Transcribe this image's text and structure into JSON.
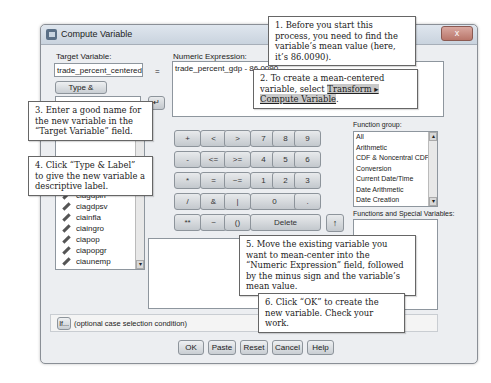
{
  "window": {
    "title": "Compute Variable",
    "close_label": "x"
  },
  "target": {
    "label": "Target Variable:",
    "value": "trade_percent_centered",
    "equals": "=",
    "type_label_button": "Type & Label..."
  },
  "expression": {
    "label": "Numeric Expression:",
    "value": "trade_percent_gdp - 86.0090"
  },
  "variables": {
    "items": [
      {
        "name": "business_starts",
        "type": "scale"
      },
      {
        "name": "ciagdpag",
        "type": "scale"
      },
      {
        "name": "ciagdpin",
        "type": "scale"
      },
      {
        "name": "ciagdpsv",
        "type": "scale"
      },
      {
        "name": "ciainfla",
        "type": "scale"
      },
      {
        "name": "ciaingro",
        "type": "scale"
      },
      {
        "name": "ciapop",
        "type": "scale"
      },
      {
        "name": "ciapopgr",
        "type": "scale"
      },
      {
        "name": "ciaunemp",
        "type": "scale"
      },
      {
        "name": "civil_war",
        "type": "nominal"
      },
      {
        "name": "colony",
        "type": "nominal"
      }
    ]
  },
  "keypad": {
    "keys": [
      "+",
      "<",
      ">",
      "7",
      "8",
      "9",
      "-",
      "<=",
      ">=",
      "4",
      "5",
      "6",
      "*",
      "=",
      "~=",
      "1",
      "2",
      "3",
      "/",
      "&",
      "|",
      "0",
      ".",
      "**",
      "~",
      "()",
      "Delete"
    ],
    "move_arrow": "↑"
  },
  "function_group": {
    "label": "Function group:",
    "items": [
      "All",
      "Arithmetic",
      "CDF & Noncentral CDF",
      "Conversion",
      "Current Date/Time",
      "Date Arithmetic",
      "Date Creation"
    ]
  },
  "functions_special": {
    "label": "Functions and Special Variables:"
  },
  "if_row": {
    "button": "If...",
    "text": "(optional case selection condition)"
  },
  "footer": {
    "buttons": [
      "OK",
      "Paste",
      "Reset",
      "Cancel",
      "Help"
    ]
  },
  "callouts": {
    "c1": "1. Before you start this process, you need to find the variable’s mean value (here, it’s 86.0090).",
    "c2_prefix": "2. To create a mean-centered variable, select ",
    "c2_menu": "Transform ▸ Compute Variable",
    "c2_suffix": ".",
    "c3": "3. Enter a good name for the new variable in the “Target Variable” field.",
    "c4": "4. Click “Type & Label” to give the new variable a descriptive label.",
    "c5": "5. Move the existing variable you want to mean-center into the “Numeric Expression” field, followed by the minus sign and the variable’s mean value.",
    "c6": "6. Click “OK” to create the new variable. Check your work."
  }
}
